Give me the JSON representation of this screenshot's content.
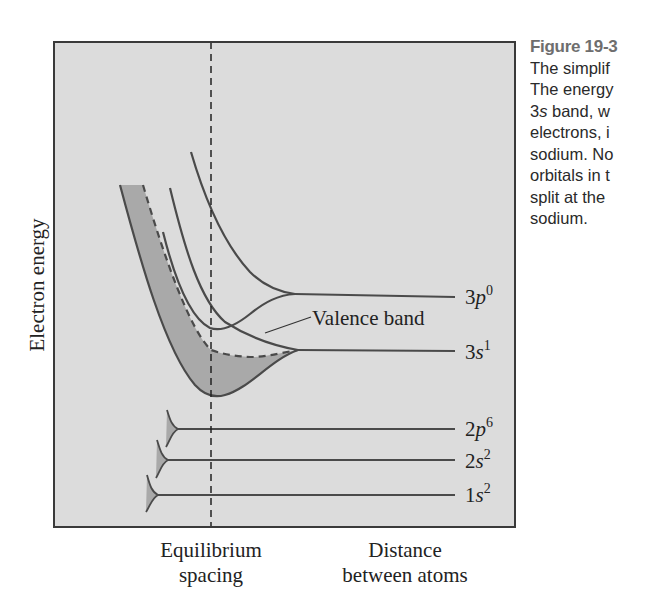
{
  "caption": {
    "figure_label": "Figure 19-3",
    "lines": [
      "The simplif",
      "The energy",
      {
        "italic": "s",
        "prefix": "3",
        "suffix": " band, w"
      },
      "electrons, i",
      "sodium. No",
      "orbitals in t",
      "split at the",
      "sodium."
    ],
    "line_texts": {
      "l1": "The simplif",
      "l2": "The energy",
      "l3_prefix": "3",
      "l3_italic": "s",
      "l3_suffix": " band, w",
      "l4": "electrons, i",
      "l5": "sodium. No",
      "l6": "orbitals in t",
      "l7": "split at the",
      "l8": "sodium."
    }
  },
  "diagram": {
    "y_axis_label": "Electron energy",
    "x_labels": {
      "equilibrium": [
        "Equilibrium",
        "spacing"
      ],
      "distance": [
        "Distance",
        "between atoms"
      ]
    },
    "annotation": "Valence band",
    "levels": [
      {
        "name": "3p",
        "sup": "0"
      },
      {
        "name": "3s",
        "sup": "1"
      },
      {
        "name": "2p",
        "sup": "6"
      },
      {
        "name": "2s",
        "sup": "2"
      },
      {
        "name": "1s",
        "sup": "2"
      }
    ],
    "colors": {
      "panel": "#dcdcdc",
      "band_fill": "#a9a9a9",
      "curve": "#4a4a4a",
      "frame": "#3a3a3a"
    }
  }
}
